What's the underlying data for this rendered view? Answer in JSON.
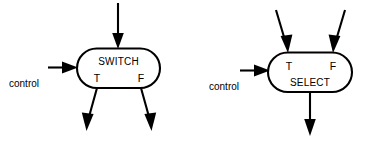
{
  "diagram": {
    "colors": {
      "stroke": "#000000",
      "fill": "#ffffff",
      "background": "#ffffff"
    },
    "blocks": [
      {
        "id": "switch",
        "label": "SWITCH",
        "control_label": "control",
        "port_true": "T",
        "port_false": "F",
        "inputs": [
          "data-in-top"
        ],
        "outputs": [
          "T",
          "F"
        ]
      },
      {
        "id": "select",
        "label": "SELECT",
        "control_label": "control",
        "port_true": "T",
        "port_false": "F",
        "inputs": [
          "T",
          "F"
        ],
        "outputs": [
          "data-out-bottom"
        ]
      }
    ]
  }
}
